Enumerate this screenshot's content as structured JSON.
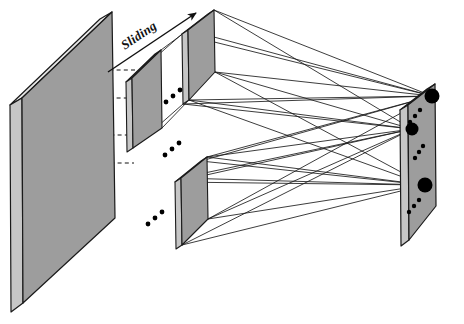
{
  "figure": {
    "type": "diagram",
    "background_color": "#ffffff",
    "annotations": {
      "sliding_label": "Sliding"
    },
    "colors": {
      "slab_face": "#9d9d9d",
      "slab_side": "#c9c9c9",
      "slab_top": "#e4e4e4",
      "outline": "#1a1a1a",
      "node_fill": "#000000",
      "dashed_guide": "#111111"
    },
    "elements": {
      "input_slab": {
        "name": "input-volume",
        "front_face": "22,98 112,12 115,218 23,303",
        "side_face": "10,105 22,98 23,303 11,312",
        "top_face": "10,105 100,19 112,12 22,98"
      },
      "receptive_field_slab": {
        "name": "receptive-field-patch",
        "front_face": "132,78 161,50 162,128 133,148",
        "side_face": "126,82 132,78 133,148 127,152",
        "top_face": "126,82 155,54 161,50 132,78"
      },
      "feature_slab_top": {
        "name": "feature-map-top",
        "front_face": "188,30 214,10 215,72 189,100",
        "side_face": "182,34 188,30 189,100 183,104",
        "top_face": "182,34 208,14 214,10 188,30"
      },
      "feature_slab_bottom": {
        "name": "feature-map-bottom",
        "front_face": "181,178 207,157 208,219 182,245",
        "side_face": "175,182 181,178 182,245 176,249",
        "top_face": "175,182 201,161 207,157 181,178"
      },
      "output_slab": {
        "name": "output-layer",
        "front_face": "408,105 435,84 436,206 409,240",
        "side_face": "400,110 408,105 409,240 401,246",
        "top_face": "400,110 427,89 435,84 408,105"
      },
      "dashed_guides": [
        {
          "name": "guide-top",
          "x1": 59,
          "y1": 70,
          "x2": 136,
          "y2": 70
        },
        {
          "name": "guide-upper",
          "x1": 23,
          "y1": 98,
          "x2": 133,
          "y2": 98
        },
        {
          "name": "guide-mid",
          "x1": 60,
          "y1": 135,
          "x2": 134,
          "y2": 135
        },
        {
          "name": "guide-lower",
          "x1": 24,
          "y1": 163,
          "x2": 134,
          "y2": 163
        }
      ],
      "sliding_arrow": {
        "name": "sliding-direction-arrow",
        "x1": 108,
        "y1": 72,
        "x2": 196,
        "y2": 13,
        "rotation_deg": -34
      },
      "output_nodes": [
        {
          "name": "output-node-1",
          "cx": 432,
          "cy": 96,
          "r": 7.5
        },
        {
          "name": "output-node-2",
          "cx": 412,
          "cy": 129,
          "r": 6.5
        },
        {
          "name": "output-node-3",
          "cx": 425,
          "cy": 185,
          "r": 7.5
        }
      ],
      "output_small_nodes": [
        {
          "cx": 420,
          "cy": 110,
          "r": 2.2
        },
        {
          "cx": 415,
          "cy": 116,
          "r": 2.2
        },
        {
          "cx": 410,
          "cy": 122,
          "r": 2.2
        },
        {
          "cx": 423,
          "cy": 146,
          "r": 2.2
        },
        {
          "cx": 419,
          "cy": 152,
          "r": 2.2
        },
        {
          "cx": 415,
          "cy": 158,
          "r": 2.2
        },
        {
          "cx": 419,
          "cy": 200,
          "r": 2.2
        },
        {
          "cx": 414,
          "cy": 206,
          "r": 2.2
        },
        {
          "cx": 409,
          "cy": 212,
          "r": 2.2
        }
      ],
      "ellipsis_groups": [
        {
          "name": "ellipsis-between-patches-1",
          "dots": [
            [
              166,
              102
            ],
            [
              173,
              96
            ],
            [
              180,
              90
            ]
          ]
        },
        {
          "name": "ellipsis-between-patches-2",
          "dots": [
            [
              165,
              155
            ],
            [
              172,
              149
            ],
            [
              179,
              143
            ]
          ]
        },
        {
          "name": "ellipsis-lower-stack",
          "dots": [
            [
              148,
              224
            ],
            [
              155,
              218
            ],
            [
              162,
              212
            ]
          ]
        }
      ]
    }
  }
}
